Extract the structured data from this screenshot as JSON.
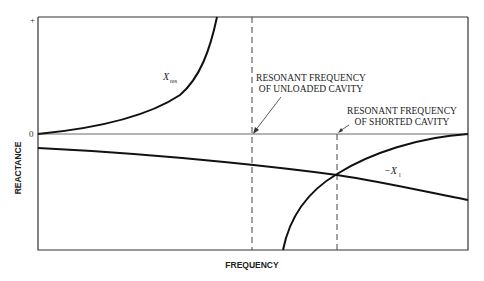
{
  "diagram": {
    "axes": {
      "x_label": "FREQUENCY",
      "y_label": "REACTANCE",
      "y_tick_plus": "+",
      "y_tick_zero": "0"
    },
    "curves": {
      "x_res_label": "X",
      "x_res_subscript": "res",
      "x_l_label": "−X",
      "x_l_subscript": "l"
    },
    "annotations": {
      "unloaded_line1": "RESONANT FREQUENCY",
      "unloaded_line2": "OF UNLOADED CAVITY",
      "shorted_line1": "RESONANT FREQUENCY",
      "shorted_line2": "OF SHORTED CAVITY"
    },
    "colors": {
      "ink": "#222222",
      "background": "#ffffff"
    }
  }
}
